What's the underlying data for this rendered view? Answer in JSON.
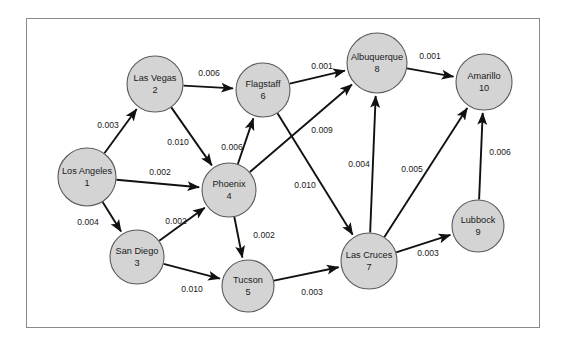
{
  "diagram": {
    "type": "directed-weighted-graph",
    "title": "",
    "frame": {
      "x": 26,
      "y": 18,
      "width": 514,
      "height": 310,
      "border_color": "#8a8a8a"
    },
    "colors": {
      "node_fill": "#d4d4d4",
      "node_stroke": "#5a5a5a",
      "edge": "#111111",
      "text": "#1a1a1a",
      "background": "#ffffff"
    },
    "nodes": [
      {
        "id": "1",
        "label": "Los Angeles",
        "number": "1",
        "x": 87,
        "y": 177,
        "r": 29
      },
      {
        "id": "2",
        "label": "Las Vegas",
        "number": "2",
        "x": 155,
        "y": 84,
        "r": 28
      },
      {
        "id": "3",
        "label": "San Diego",
        "number": "3",
        "x": 137,
        "y": 257,
        "r": 27
      },
      {
        "id": "4",
        "label": "Phoenix",
        "number": "4",
        "x": 229,
        "y": 190,
        "r": 27
      },
      {
        "id": "5",
        "label": "Tucson",
        "number": "5",
        "x": 248,
        "y": 286,
        "r": 26
      },
      {
        "id": "6",
        "label": "Flagstaff",
        "number": "6",
        "x": 263,
        "y": 90,
        "r": 27
      },
      {
        "id": "7",
        "label": "Las Cruces",
        "number": "7",
        "x": 369,
        "y": 261,
        "r": 28
      },
      {
        "id": "8",
        "label": "Albuquerque",
        "number": "8",
        "x": 377,
        "y": 63,
        "r": 30
      },
      {
        "id": "9",
        "label": "Lubbock",
        "number": "9",
        "x": 478,
        "y": 226,
        "r": 26
      },
      {
        "id": "10",
        "label": "Amarillo",
        "number": "10",
        "x": 484,
        "y": 82,
        "r": 28
      }
    ],
    "edges": [
      {
        "from": "1",
        "to": "2",
        "weight": "0.003",
        "lx": 108,
        "ly": 126
      },
      {
        "from": "1",
        "to": "4",
        "weight": "0.002",
        "lx": 160,
        "ly": 173
      },
      {
        "from": "1",
        "to": "3",
        "weight": "0.004",
        "lx": 88,
        "ly": 223
      },
      {
        "from": "2",
        "to": "6",
        "weight": "0.006",
        "lx": 209,
        "ly": 74
      },
      {
        "from": "2",
        "to": "4",
        "weight": "0.010",
        "lx": 178,
        "ly": 143
      },
      {
        "from": "3",
        "to": "4",
        "weight": "0.002",
        "lx": 176,
        "ly": 222
      },
      {
        "from": "3",
        "to": "5",
        "weight": "0.010",
        "lx": 192,
        "ly": 290
      },
      {
        "from": "4",
        "to": "6",
        "weight": "0.006",
        "lx": 232,
        "ly": 148
      },
      {
        "from": "4",
        "to": "8",
        "weight": "0.009",
        "lx": 322,
        "ly": 131
      },
      {
        "from": "4",
        "to": "5",
        "weight": "0.002",
        "lx": 264,
        "ly": 236
      },
      {
        "from": "6",
        "to": "8",
        "weight": "0.001",
        "lx": 322,
        "ly": 67
      },
      {
        "from": "6",
        "to": "7",
        "weight": "0.010",
        "lx": 305,
        "ly": 186
      },
      {
        "from": "5",
        "to": "7",
        "weight": "0.003",
        "lx": 312,
        "ly": 293
      },
      {
        "from": "7",
        "to": "8",
        "weight": "0.004",
        "lx": 359,
        "ly": 165
      },
      {
        "from": "7",
        "to": "10",
        "weight": "0.005",
        "lx": 412,
        "ly": 170
      },
      {
        "from": "7",
        "to": "9",
        "weight": "0.003",
        "lx": 428,
        "ly": 254
      },
      {
        "from": "8",
        "to": "10",
        "weight": "0.001",
        "lx": 430,
        "ly": 57
      },
      {
        "from": "9",
        "to": "10",
        "weight": "0.006",
        "lx": 500,
        "ly": 153
      }
    ]
  }
}
